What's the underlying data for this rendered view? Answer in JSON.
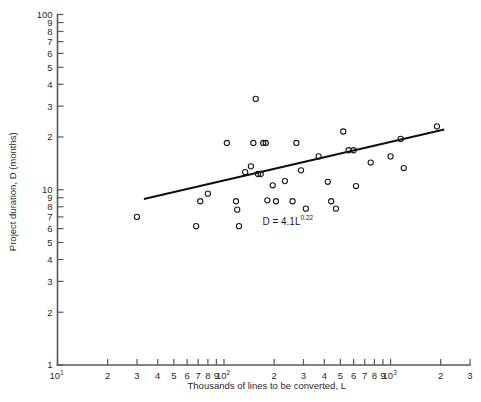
{
  "chart_data": {
    "type": "scatter",
    "title": "",
    "xlabel": "Thousands of lines to be converted, L",
    "ylabel": "Project duration, D (months)",
    "xscale": "log",
    "yscale": "log",
    "xlim": [
      10,
      3000
    ],
    "ylim": [
      1,
      100
    ],
    "grid": false,
    "legend": null,
    "annotations": [
      {
        "name": "fit-equation",
        "base": "D = 4.1L",
        "exponent": "0.22",
        "x": 170,
        "y": 6.3
      }
    ],
    "xticks": [
      {
        "value": 10,
        "label": "10",
        "sup": "1"
      },
      {
        "value": 20,
        "label": "2",
        "sup": ""
      },
      {
        "value": 30,
        "label": "3",
        "sup": ""
      },
      {
        "value": 40,
        "label": "4",
        "sup": ""
      },
      {
        "value": 50,
        "label": "5",
        "sup": ""
      },
      {
        "value": 60,
        "label": "6",
        "sup": ""
      },
      {
        "value": 70,
        "label": "7",
        "sup": ""
      },
      {
        "value": 80,
        "label": "8",
        "sup": ""
      },
      {
        "value": 90,
        "label": "9",
        "sup": ""
      },
      {
        "value": 100,
        "label": "10",
        "sup": "2"
      },
      {
        "value": 200,
        "label": "2",
        "sup": ""
      },
      {
        "value": 300,
        "label": "3",
        "sup": ""
      },
      {
        "value": 400,
        "label": "4",
        "sup": ""
      },
      {
        "value": 500,
        "label": "5",
        "sup": ""
      },
      {
        "value": 600,
        "label": "6",
        "sup": ""
      },
      {
        "value": 700,
        "label": "7",
        "sup": ""
      },
      {
        "value": 800,
        "label": "8",
        "sup": ""
      },
      {
        "value": 900,
        "label": "9",
        "sup": ""
      },
      {
        "value": 1000,
        "label": "10",
        "sup": "3"
      },
      {
        "value": 2000,
        "label": "2",
        "sup": ""
      },
      {
        "value": 3000,
        "label": "3",
        "sup": ""
      }
    ],
    "yticks": [
      {
        "value": 1,
        "label": "1"
      },
      {
        "value": 2,
        "label": "2"
      },
      {
        "value": 3,
        "label": "3"
      },
      {
        "value": 4,
        "label": "4"
      },
      {
        "value": 5,
        "label": "5"
      },
      {
        "value": 6,
        "label": "6"
      },
      {
        "value": 7,
        "label": "7"
      },
      {
        "value": 8,
        "label": "8"
      },
      {
        "value": 9,
        "label": "9"
      },
      {
        "value": 10,
        "label": "10"
      },
      {
        "value": 20,
        "label": "2"
      },
      {
        "value": 30,
        "label": "3"
      },
      {
        "value": 40,
        "label": "4"
      },
      {
        "value": 50,
        "label": "5"
      },
      {
        "value": 60,
        "label": "6"
      },
      {
        "value": 70,
        "label": "7"
      },
      {
        "value": 80,
        "label": "8"
      },
      {
        "value": 90,
        "label": "9"
      },
      {
        "value": 100,
        "label": "100"
      }
    ],
    "yticks_minor_unlabeled": [],
    "points": [
      {
        "x": 30,
        "y": 7.0
      },
      {
        "x": 68,
        "y": 6.2
      },
      {
        "x": 72,
        "y": 8.6
      },
      {
        "x": 80,
        "y": 9.5
      },
      {
        "x": 104,
        "y": 18.5
      },
      {
        "x": 118,
        "y": 8.6
      },
      {
        "x": 120,
        "y": 7.7
      },
      {
        "x": 123,
        "y": 6.2
      },
      {
        "x": 134,
        "y": 12.6
      },
      {
        "x": 145,
        "y": 13.6
      },
      {
        "x": 150,
        "y": 18.5
      },
      {
        "x": 155,
        "y": 33.0
      },
      {
        "x": 160,
        "y": 12.3
      },
      {
        "x": 166,
        "y": 12.3
      },
      {
        "x": 172,
        "y": 18.5
      },
      {
        "x": 178,
        "y": 18.5
      },
      {
        "x": 182,
        "y": 8.7
      },
      {
        "x": 196,
        "y": 10.6
      },
      {
        "x": 205,
        "y": 8.6
      },
      {
        "x": 232,
        "y": 11.2
      },
      {
        "x": 258,
        "y": 8.6
      },
      {
        "x": 272,
        "y": 18.5
      },
      {
        "x": 290,
        "y": 12.9
      },
      {
        "x": 310,
        "y": 7.8
      },
      {
        "x": 370,
        "y": 15.5
      },
      {
        "x": 420,
        "y": 11.1
      },
      {
        "x": 440,
        "y": 8.6
      },
      {
        "x": 470,
        "y": 7.8
      },
      {
        "x": 520,
        "y": 21.5
      },
      {
        "x": 560,
        "y": 16.8
      },
      {
        "x": 600,
        "y": 16.8
      },
      {
        "x": 620,
        "y": 10.5
      },
      {
        "x": 760,
        "y": 14.3
      },
      {
        "x": 1000,
        "y": 15.5
      },
      {
        "x": 1150,
        "y": 19.5
      },
      {
        "x": 1200,
        "y": 13.3
      },
      {
        "x": 1900,
        "y": 23.0
      }
    ],
    "fit": {
      "coefficient": 4.1,
      "exponent": 0.22,
      "x_start": 33,
      "x_end": 2100,
      "label": "D = 4.1L^0.22"
    }
  }
}
